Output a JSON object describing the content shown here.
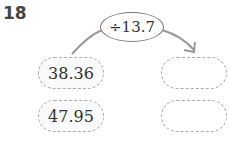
{
  "problem_number": "18",
  "operation": "÷13.7",
  "inputs": [
    "38.36",
    "47.95"
  ],
  "outputs": [
    "",
    ""
  ]
}
